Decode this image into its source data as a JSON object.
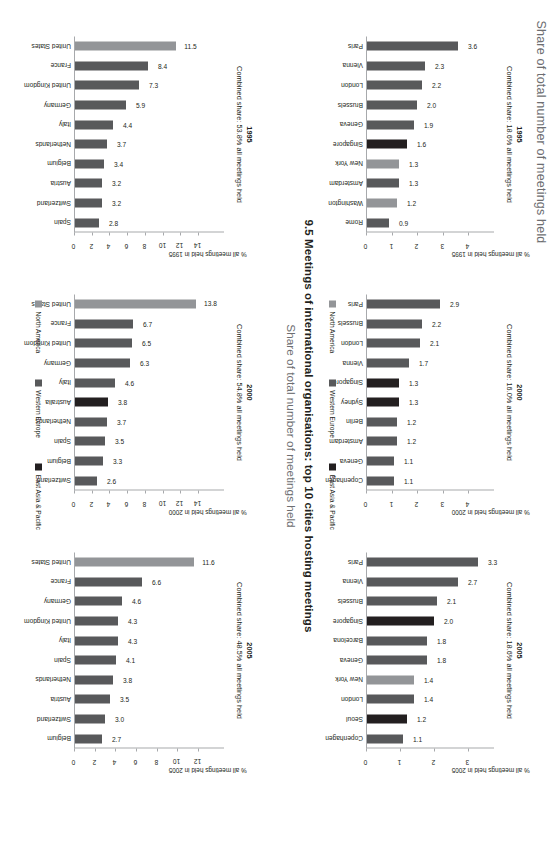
{
  "header": {
    "top_label": "Share of total number of meetings held"
  },
  "title": "9.5 Meetings of international organisations: top 10 cities hosting meetings",
  "subtitle": "Share of total number of meetings held",
  "legend": {
    "position": "bottom-center",
    "items": [
      {
        "label": "North America",
        "color": "#939598"
      },
      {
        "label": "Western Europe",
        "color": "#58595b"
      },
      {
        "label": "East Asia & Pacific",
        "color": "#231f20"
      }
    ]
  },
  "colors": {
    "north_america": "#939598",
    "western_europe": "#58595b",
    "east_asia_pacific": "#231f20",
    "axis": "#a7a9ac",
    "text": "#231f20",
    "muted_text": "#6d6e71"
  },
  "chart_data": [
    {
      "id": "countries-1995",
      "type": "bar",
      "title": "1995",
      "subtitle": "Combined share: 53.8% all meetings held",
      "xlabel": "",
      "ylabel": "% all meetings held in 1995",
      "ylim": [
        0,
        14
      ],
      "yticks": [
        0,
        2,
        4,
        6,
        8,
        10,
        12,
        14
      ],
      "grid": false,
      "categories": [
        "United States",
        "France",
        "United Kingdom",
        "Germany",
        "Italy",
        "Netherlands",
        "Belgium",
        "Austria",
        "Switzerland",
        "Spain"
      ],
      "values": [
        11.5,
        8.4,
        7.3,
        5.9,
        4.4,
        3.7,
        3.4,
        3.2,
        3.2,
        2.8
      ],
      "regions": [
        "north_america",
        "western_europe",
        "western_europe",
        "western_europe",
        "western_europe",
        "western_europe",
        "western_europe",
        "western_europe",
        "western_europe",
        "western_europe"
      ]
    },
    {
      "id": "countries-2000",
      "type": "bar",
      "title": "2000",
      "subtitle": "Combined share: 54.8% all meetings held",
      "xlabel": "",
      "ylabel": "% all meetings held in 2000",
      "ylim": [
        0,
        14
      ],
      "yticks": [
        0,
        2,
        4,
        6,
        8,
        10,
        12,
        14
      ],
      "grid": false,
      "categories": [
        "United States",
        "France",
        "United Kingdom",
        "Germany",
        "Italy",
        "Australia",
        "Netherlands",
        "Spain",
        "Belgium",
        "Switzerland"
      ],
      "values": [
        13.8,
        6.7,
        6.5,
        6.3,
        4.6,
        3.8,
        3.7,
        3.5,
        3.3,
        2.6
      ],
      "regions": [
        "north_america",
        "western_europe",
        "western_europe",
        "western_europe",
        "western_europe",
        "east_asia_pacific",
        "western_europe",
        "western_europe",
        "western_europe",
        "western_europe"
      ]
    },
    {
      "id": "countries-2005",
      "type": "bar",
      "title": "2005",
      "subtitle": "Combined share: 48.5% all meetings held",
      "xlabel": "",
      "ylabel": "% all meetings held in 2005",
      "ylim": [
        0,
        12
      ],
      "yticks": [
        0,
        2,
        4,
        6,
        8,
        10,
        12
      ],
      "grid": false,
      "categories": [
        "United States",
        "France",
        "Germany",
        "United Kingdom",
        "Italy",
        "Spain",
        "Netherlands",
        "Austria",
        "Switzerland",
        "Belgium"
      ],
      "values": [
        11.6,
        6.6,
        4.6,
        4.3,
        4.3,
        4.1,
        3.8,
        3.5,
        3.0,
        2.7
      ],
      "regions": [
        "north_america",
        "western_europe",
        "western_europe",
        "western_europe",
        "western_europe",
        "western_europe",
        "western_europe",
        "western_europe",
        "western_europe",
        "western_europe"
      ]
    },
    {
      "id": "cities-1995",
      "type": "bar",
      "title": "1995",
      "subtitle": "Combined share: 18.6% all meetings held",
      "xlabel": "",
      "ylabel": "% all meetings held in 1995",
      "ylim": [
        0,
        4
      ],
      "yticks": [
        0,
        1,
        2,
        3,
        4
      ],
      "grid": false,
      "categories": [
        "Paris",
        "Vienna",
        "London",
        "Brussels",
        "Geneva",
        "Singapore",
        "New York",
        "Amsterdam",
        "Washington",
        "Rome"
      ],
      "values": [
        3.6,
        2.3,
        2.2,
        2.0,
        1.9,
        1.6,
        1.3,
        1.3,
        1.2,
        0.9
      ],
      "regions": [
        "western_europe",
        "western_europe",
        "western_europe",
        "western_europe",
        "western_europe",
        "east_asia_pacific",
        "north_america",
        "western_europe",
        "north_america",
        "western_europe"
      ]
    },
    {
      "id": "cities-2000",
      "type": "bar",
      "title": "2000",
      "subtitle": "Combined share: 16.0% all meetings held",
      "xlabel": "",
      "ylabel": "% all meetings held in 2000",
      "ylim": [
        0,
        4
      ],
      "yticks": [
        0,
        1,
        2,
        3,
        4
      ],
      "grid": false,
      "categories": [
        "Paris",
        "Brussels",
        "London",
        "Vienna",
        "Singapore",
        "Sydney",
        "Berlin",
        "Amsterdam",
        "Geneva",
        "Copenhagen"
      ],
      "values": [
        2.9,
        2.2,
        2.1,
        1.7,
        1.3,
        1.3,
        1.2,
        1.2,
        1.1,
        1.1
      ],
      "regions": [
        "western_europe",
        "western_europe",
        "western_europe",
        "western_europe",
        "east_asia_pacific",
        "east_asia_pacific",
        "western_europe",
        "western_europe",
        "western_europe",
        "western_europe"
      ]
    },
    {
      "id": "cities-2005",
      "type": "bar",
      "title": "2005",
      "subtitle": "Combined share: 18.6% all meetings held",
      "xlabel": "",
      "ylabel": "% all meetings held in 2005",
      "ylim": [
        0,
        3
      ],
      "yticks": [
        0,
        1,
        2,
        3
      ],
      "grid": false,
      "categories": [
        "Paris",
        "Vienna",
        "Brussels",
        "Singapore",
        "Barcelona",
        "Geneva",
        "New York",
        "London",
        "Seoul",
        "Copenhagen"
      ],
      "values": [
        3.3,
        2.7,
        2.1,
        2.0,
        1.8,
        1.8,
        1.4,
        1.4,
        1.2,
        1.1
      ],
      "regions": [
        "western_europe",
        "western_europe",
        "western_europe",
        "east_asia_pacific",
        "western_europe",
        "western_europe",
        "north_america",
        "western_europe",
        "east_asia_pacific",
        "western_europe"
      ]
    }
  ]
}
